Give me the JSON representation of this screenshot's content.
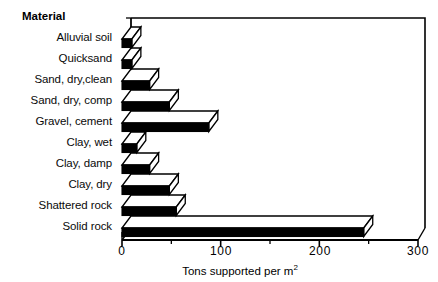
{
  "chart_data": {
    "type": "bar",
    "orientation": "horizontal",
    "title": "",
    "xlabel": "Tons supported per m2",
    "xlabel_display": "Tons supported per m",
    "xlabel_superscript": "2",
    "ylabel": "Material",
    "categories": [
      "Alluvial soil",
      "Quicksand",
      "Sand, dry,clean",
      "Sand, dry, comp",
      "Gravel, cement",
      "Clay, wet",
      "Clay, damp",
      "Clay, dry",
      "Shattered rock",
      "Solid rock"
    ],
    "values": [
      10,
      10,
      28,
      48,
      88,
      15,
      28,
      48,
      55,
      245
    ],
    "xlim": [
      0,
      300
    ],
    "xticks": [
      0,
      100,
      200,
      300
    ],
    "xtick_labels": [
      "0",
      "100",
      "200",
      "300"
    ],
    "xminor_step": 50,
    "grid": false,
    "legend": "none",
    "style": "3d-horizontal-bar",
    "bar_face_color": "#000000",
    "bar_top_color": "#ffffff",
    "frame_color": "#000000",
    "background_color": "#ffffff"
  },
  "axis": {
    "category_header": "Material"
  }
}
